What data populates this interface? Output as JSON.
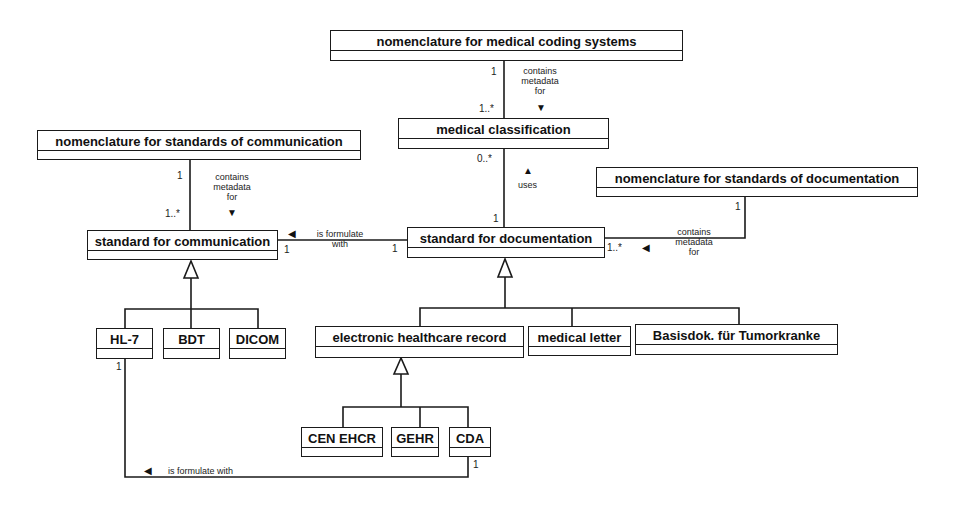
{
  "classes": {
    "nom_coding": "nomenclature for medical coding systems",
    "med_class": "medical classification",
    "nom_comm": "nomenclature for standards of communication",
    "std_comm": "standard for communication",
    "nom_doc": "nomenclature for standards of documentation",
    "std_doc": "standard for documentation",
    "hl7": "HL-7",
    "bdt": "BDT",
    "dicom": "DICOM",
    "ehr": "electronic healthcare record",
    "med_letter": "medical letter",
    "basisdok": "Basisdok. für Tumorkranke",
    "cen_ehcr": "CEN EHCR",
    "gehr": "GEHR",
    "cda": "CDA"
  },
  "associations": {
    "contains_line1": "contains",
    "contains_line2": "metadata",
    "contains_line3": "for",
    "uses": "uses",
    "formulate_line1": "is formulate",
    "formulate_line2": "with",
    "formulate_full": "is formulate with"
  },
  "multiplicities": {
    "one": "1",
    "one_many": "1..*",
    "zero_many": "0..*"
  },
  "arrows": {
    "down": "▼",
    "up": "▲",
    "left": "◀"
  }
}
